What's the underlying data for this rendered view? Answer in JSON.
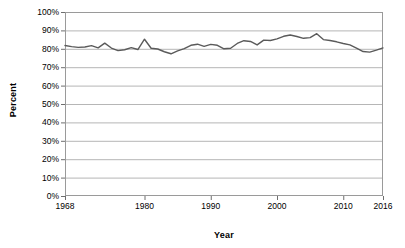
{
  "chart_data": {
    "type": "line",
    "title": "",
    "xlabel": "Year",
    "ylabel": "Percent",
    "xlim": [
      1968,
      2016
    ],
    "ylim": [
      0,
      100
    ],
    "grid": true,
    "legend": "none",
    "y_tick_labels": [
      "100%",
      "90%",
      "80%",
      "70%",
      "60%",
      "50%",
      "40%",
      "30%",
      "20%",
      "10%",
      "0%"
    ],
    "y_tick_values": [
      100,
      90,
      80,
      70,
      60,
      50,
      40,
      30,
      20,
      10,
      0
    ],
    "x_tick_labels": [
      "1968",
      "1980",
      "1990",
      "2000",
      "2010",
      "2016"
    ],
    "x_tick_values": [
      1968,
      1980,
      1990,
      2000,
      2010,
      2016
    ],
    "series": [
      {
        "name": "Percent",
        "color": "#5a5a5a",
        "x": [
          1968,
          1969,
          1970,
          1971,
          1972,
          1973,
          1974,
          1975,
          1976,
          1977,
          1978,
          1979,
          1980,
          1981,
          1982,
          1983,
          1984,
          1985,
          1986,
          1987,
          1988,
          1989,
          1990,
          1991,
          1992,
          1993,
          1994,
          1995,
          1996,
          1997,
          1998,
          1999,
          2000,
          2001,
          2002,
          2003,
          2004,
          2005,
          2006,
          2007,
          2008,
          2009,
          2010,
          2011,
          2012,
          2013,
          2014,
          2015,
          2016
        ],
        "values": [
          81.8,
          81.2,
          80.8,
          81.0,
          81.7,
          80.5,
          83.1,
          80.4,
          79.0,
          79.5,
          80.6,
          79.6,
          85.2,
          80.3,
          79.9,
          78.4,
          77.3,
          78.9,
          80.1,
          81.9,
          82.5,
          81.3,
          82.4,
          81.9,
          80.0,
          80.3,
          82.9,
          84.4,
          84.0,
          82.1,
          84.7,
          84.5,
          85.4,
          86.8,
          87.5,
          86.7,
          85.7,
          86.1,
          88.2,
          85.0,
          84.5,
          83.8,
          82.9,
          82.1,
          80.4,
          78.5,
          78.2,
          79.3,
          80.5
        ]
      }
    ],
    "series_extra_note": ""
  },
  "axis": {
    "y_title": "Percent",
    "x_title": "Year"
  }
}
